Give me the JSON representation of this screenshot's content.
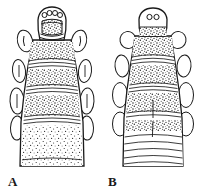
{
  "figure": {
    "background_color": "#ffffff",
    "ink_color": "#141414",
    "stipple_color": "#2b2b2b",
    "panel_count": 2
  },
  "panels": [
    {
      "id": "A",
      "label": "A",
      "label_position": {
        "x": 8,
        "y": 175
      },
      "description": "Dorsal view of larval head capsule and anterior segments, heavily stippled throughout including terminal segment",
      "head": {
        "shape": "rounded-dome head capsule with notched anterior margin",
        "ocelli_count": 4,
        "ocelli_arrangement": "arc of four small circles across anterior margin of head",
        "clypeal_plate": "large stippled semicircular plate beneath ocelli",
        "lateral_lobes": 2,
        "lateral_lobe_marking": "single curved crescent line inside each lobe"
      },
      "segments": {
        "count": 5,
        "banding": "alternating dense stippled bands and pale transverse ridges",
        "terminal_texture": "dense uniform stipple (no transverse lines)"
      },
      "lateral_appendages": {
        "pairs": 3,
        "shape": "elongate oval lobes with internal longitudinal line",
        "side": "both left and right margins"
      }
    },
    {
      "id": "B",
      "label": "B",
      "label_position": {
        "x": 108,
        "y": 175
      },
      "description": "Dorsal view of larval head capsule and anterior body segments, stippled anteriorly with smooth transversely striate posterior region",
      "head": {
        "shape": "rounded trapezoid head capsule, smooth outline",
        "ocelli_count": 2,
        "ocelli_arrangement": "pair of small circles set side by side on upper head",
        "clypeal_plate": "narrow stippled band across lower head",
        "lateral_lobes": 0,
        "lateral_lobe_marking": "none"
      },
      "segments": {
        "count": 6,
        "banding": "stippled bands anteriorly, grading into smooth arched transverse lines posteriorly",
        "terminal_texture": "series of curved transverse lines with median longitudinal seam"
      },
      "lateral_appendages": {
        "pairs": 4,
        "shape": "rounded oval lobes along lateral margin",
        "side": "both left and right margins"
      }
    }
  ]
}
